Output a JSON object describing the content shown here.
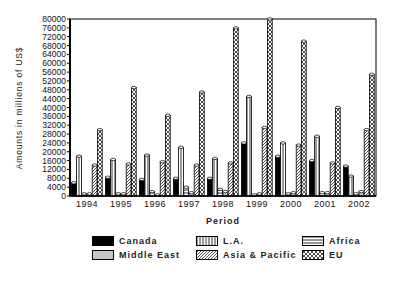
{
  "chart_data": {
    "type": "bar",
    "title": "",
    "xlabel": "Period",
    "ylabel": "Amounts in millions of US$",
    "ylim": [
      0,
      80000
    ],
    "yticks": [
      0,
      4000,
      8000,
      12000,
      16000,
      20000,
      24000,
      28000,
      32000,
      36000,
      40000,
      44000,
      48000,
      52000,
      56000,
      60000,
      64000,
      68000,
      72000,
      76000,
      80000
    ],
    "grid": false,
    "legend_position": "bottom",
    "categories": [
      "1994",
      "1995",
      "1996",
      "1997",
      "1998",
      "1999",
      "2000",
      "2001",
      "2002"
    ],
    "series": [
      {
        "name": "Canada",
        "pattern": "solid-black",
        "values": [
          6000,
          8500,
          7500,
          8000,
          8000,
          24000,
          18000,
          16000,
          13500
        ]
      },
      {
        "name": "L.A.",
        "pattern": "vertical-lines",
        "values": [
          18000,
          16500,
          18500,
          22000,
          17000,
          45000,
          24000,
          27000,
          9000
        ]
      },
      {
        "name": "Africa",
        "pattern": "horizontal-lines",
        "values": [
          1000,
          1000,
          2000,
          4000,
          3000,
          500,
          1000,
          1500,
          1000
        ]
      },
      {
        "name": "Middle East",
        "pattern": "light-gray",
        "values": [
          1000,
          1000,
          500,
          1500,
          2000,
          1000,
          1500,
          1500,
          2000
        ]
      },
      {
        "name": "Asia & Pacific",
        "pattern": "diagonal-lines",
        "values": [
          14000,
          14500,
          15500,
          14000,
          15000,
          31000,
          23000,
          15000,
          30000
        ]
      },
      {
        "name": "EU",
        "pattern": "crosshatch",
        "values": [
          30000,
          49000,
          36500,
          47000,
          76000,
          80000,
          70000,
          40000,
          55000
        ]
      }
    ]
  },
  "legend": {
    "items": [
      {
        "label": "Canada"
      },
      {
        "label": "L.A."
      },
      {
        "label": "Africa"
      },
      {
        "label": "Middle East"
      },
      {
        "label": "Asia & Pacific"
      },
      {
        "label": "EU"
      }
    ]
  },
  "axis": {
    "x_title": "Period",
    "y_title": "Amounts in millions of US$"
  }
}
